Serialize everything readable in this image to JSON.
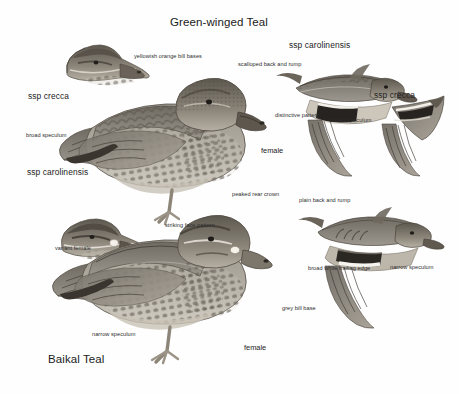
{
  "plate": {
    "background": "#fefefe",
    "ink": "#2a2a2a",
    "titles": {
      "top": "Green-winged Teal",
      "bottom": "Baikal Teal"
    },
    "top_species": {
      "name": "Green-winged Teal",
      "labels": {
        "ssp_crecca_head": "ssp crecca",
        "bill_bases": "yellowish orange\nbill bases",
        "scalloped": "scalloped back\nand rump",
        "ssp_carolinensis_flight": "ssp carolinensis",
        "ssp_crecca_wing": "ssp crecca",
        "distinctive_pattern": "distinctive\npattern",
        "broad_speculum_right": "broad\nspeculum",
        "broad_speculum_left": "broad\nspeculum",
        "ssp_carolinensis_body": "ssp carolinensis",
        "female": "female"
      }
    },
    "bottom_species": {
      "name": "Baikal Teal",
      "labels": {
        "variant_female": "variant\nfemale",
        "striking_face": "striking\nface pattern",
        "peaked_crown": "peaked\nrear crown",
        "plain_back": "plain back\nand rump",
        "broad_white_edge": "broad white\ntrailing edge",
        "narrow_speculum_flight": "narrow\nspeculum",
        "narrow_speculum_body": "narrow speculum",
        "grey_bill_base": "grey\nbill base",
        "female": "female"
      }
    },
    "figures": [
      {
        "name": "gwt-crecca-head",
        "species": "Green-winged Teal",
        "pose": "head-profile",
        "subspecies": "crecca"
      },
      {
        "name": "gwt-carolinensis-standing-female",
        "species": "Green-winged Teal",
        "pose": "standing",
        "subspecies": "carolinensis",
        "sex": "female"
      },
      {
        "name": "gwt-carolinensis-flight",
        "species": "Green-winged Teal",
        "pose": "flying",
        "subspecies": "carolinensis"
      },
      {
        "name": "gwt-crecca-wing",
        "species": "Green-winged Teal",
        "pose": "wing-detail",
        "subspecies": "crecca"
      },
      {
        "name": "baikal-variant-female-head",
        "species": "Baikal Teal",
        "pose": "head-profile",
        "sex": "variant female"
      },
      {
        "name": "baikal-standing-female",
        "species": "Baikal Teal",
        "pose": "standing",
        "sex": "female"
      },
      {
        "name": "baikal-flight",
        "species": "Baikal Teal",
        "pose": "flying"
      }
    ]
  }
}
